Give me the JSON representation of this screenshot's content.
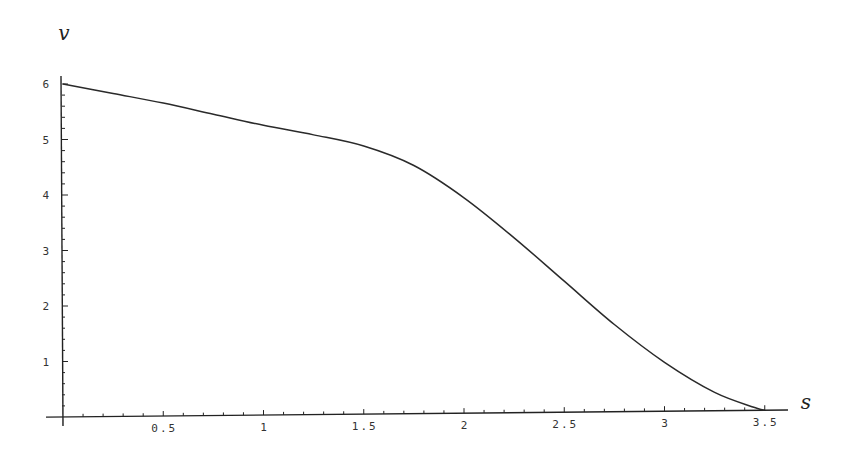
{
  "chart_data": {
    "type": "line",
    "title": "",
    "xlabel": "s",
    "ylabel": "v",
    "xlim": [
      0,
      3.6
    ],
    "ylim": [
      0,
      6.1
    ],
    "grid": false,
    "legend": null,
    "x_ticks": [
      0.5,
      1,
      1.5,
      2,
      2.5,
      3,
      3.5
    ],
    "x_tick_labels": [
      "0.5",
      "1",
      "1.5",
      "2",
      "2.5",
      "3",
      "3.5"
    ],
    "x_minor_step": 0.1,
    "y_ticks": [
      1,
      2,
      3,
      4,
      5,
      6
    ],
    "y_tick_labels": [
      "1",
      "2",
      "3",
      "4",
      "5",
      "6"
    ],
    "y_minor_step": 0.2,
    "series": [
      {
        "name": "v(s)",
        "x": [
          0,
          0.25,
          0.5,
          0.75,
          1.0,
          1.25,
          1.5,
          1.75,
          2.0,
          2.25,
          2.5,
          2.75,
          3.0,
          3.25,
          3.45,
          3.5
        ],
        "values": [
          6.0,
          5.82,
          5.64,
          5.43,
          5.22,
          5.04,
          4.83,
          4.47,
          3.88,
          3.15,
          2.36,
          1.57,
          0.88,
          0.33,
          0.05,
          0.0
        ]
      }
    ]
  },
  "axes": {
    "x_title": "s",
    "y_title": "v"
  }
}
